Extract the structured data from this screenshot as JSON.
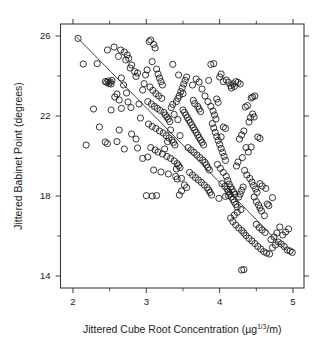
{
  "figure": {
    "background_color": "#ffffff",
    "foreground_color": "#1a1a1a"
  },
  "chart_data": {
    "type": "scatter",
    "title": "",
    "xlabel": "Jittered Cube Root Concentration (μg     /m)",
    "xlabel_parts": {
      "prefix": "Jittered Cube Root Concentration (µg",
      "exponent": "1/3",
      "suffix": "/m)"
    },
    "ylabel": "Jittered Babinet Point (degrees)",
    "xlim": [
      1.83,
      5.15
    ],
    "ylim": [
      13.4,
      26.6
    ],
    "xticks": [
      2,
      3,
      4,
      5
    ],
    "xticklabels": [
      "2",
      "3",
      "4",
      "5"
    ],
    "xticks_minor": [
      2.5,
      3.5,
      4.5
    ],
    "yticks": [
      14,
      18,
      22,
      26
    ],
    "yticklabels": [
      "14",
      "18",
      "22",
      "26"
    ],
    "yticks_minor": [
      16,
      20,
      24
    ],
    "grid": false,
    "legend": null,
    "frame": "box",
    "marker": "open-circle",
    "marker_size_px": 3.1,
    "marker_color": "#151515",
    "n_points": 318,
    "fit_line": {
      "type": "least-squares",
      "x": [
        2.05,
        4.92
      ],
      "y": [
        25.95,
        15.25
      ],
      "slope": -3.73,
      "intercept": 33.6,
      "color": "#2b2b2b"
    },
    "points": [
      [
        2.07,
        25.88
      ],
      [
        2.14,
        24.6
      ],
      [
        2.33,
        24.62
      ],
      [
        2.44,
        23.72
      ],
      [
        2.46,
        23.68
      ],
      [
        2.48,
        23.75
      ],
      [
        2.49,
        23.62
      ],
      [
        2.51,
        23.7
      ],
      [
        2.52,
        23.6
      ],
      [
        2.53,
        23.78
      ],
      [
        2.47,
        25.3
      ],
      [
        2.56,
        25.45
      ],
      [
        2.62,
        24.98
      ],
      [
        2.65,
        25.3
      ],
      [
        2.7,
        25.2
      ],
      [
        2.72,
        24.8
      ],
      [
        2.74,
        25.05
      ],
      [
        2.76,
        24.88
      ],
      [
        2.78,
        24.4
      ],
      [
        2.8,
        24.55
      ],
      [
        2.66,
        23.9
      ],
      [
        2.69,
        23.55
      ],
      [
        2.84,
        24.22
      ],
      [
        2.86,
        23.98
      ],
      [
        2.88,
        24.15
      ],
      [
        2.57,
        22.95
      ],
      [
        2.6,
        23.1
      ],
      [
        2.63,
        22.8
      ],
      [
        2.73,
        23.15
      ],
      [
        2.75,
        22.7
      ],
      [
        2.28,
        22.35
      ],
      [
        2.52,
        22.3
      ],
      [
        2.66,
        22.38
      ],
      [
        2.79,
        22.42
      ],
      [
        2.9,
        22.6
      ],
      [
        2.36,
        21.45
      ],
      [
        2.63,
        21.3
      ],
      [
        2.8,
        21.1
      ],
      [
        2.86,
        20.85
      ],
      [
        2.6,
        20.72
      ],
      [
        2.18,
        20.55
      ],
      [
        2.44,
        20.7
      ],
      [
        2.47,
        20.62
      ],
      [
        2.7,
        20.35
      ],
      [
        2.88,
        20.4
      ],
      [
        2.92,
        21.9
      ],
      [
        2.95,
        23.3
      ],
      [
        2.97,
        23.62
      ],
      [
        2.99,
        24.05
      ],
      [
        3.01,
        24.3
      ],
      [
        3.04,
        25.72
      ],
      [
        3.06,
        25.8
      ],
      [
        3.1,
        25.58
      ],
      [
        3.12,
        25.4
      ],
      [
        3.08,
        24.72
      ],
      [
        3.14,
        24.35
      ],
      [
        3.16,
        24.1
      ],
      [
        3.18,
        23.9
      ],
      [
        3.2,
        23.72
      ],
      [
        3.22,
        23.55
      ],
      [
        3.05,
        23.45
      ],
      [
        3.09,
        23.28
      ],
      [
        3.13,
        23.12
      ],
      [
        3.17,
        23.0
      ],
      [
        3.21,
        22.88
      ],
      [
        3.02,
        22.72
      ],
      [
        3.07,
        22.6
      ],
      [
        3.11,
        22.48
      ],
      [
        3.15,
        22.38
      ],
      [
        3.19,
        22.28
      ],
      [
        3.24,
        22.18
      ],
      [
        3.26,
        22.05
      ],
      [
        3.28,
        21.95
      ],
      [
        3.3,
        21.85
      ],
      [
        3.32,
        21.72
      ],
      [
        3.03,
        21.6
      ],
      [
        3.08,
        21.48
      ],
      [
        3.13,
        21.38
      ],
      [
        3.18,
        21.25
      ],
      [
        3.23,
        21.15
      ],
      [
        3.27,
        21.02
      ],
      [
        3.31,
        20.9
      ],
      [
        3.35,
        20.8
      ],
      [
        3.37,
        20.68
      ],
      [
        3.39,
        20.55
      ],
      [
        3.06,
        20.42
      ],
      [
        3.12,
        20.3
      ],
      [
        3.16,
        20.2
      ],
      [
        3.22,
        20.1
      ],
      [
        3.28,
        19.98
      ],
      [
        3.33,
        19.88
      ],
      [
        3.38,
        19.75
      ],
      [
        3.42,
        19.62
      ],
      [
        3.44,
        19.52
      ],
      [
        3.46,
        19.42
      ],
      [
        3.1,
        19.3
      ],
      [
        3.2,
        19.2
      ],
      [
        3.3,
        19.1
      ],
      [
        3.4,
        18.98
      ],
      [
        3.48,
        18.88
      ],
      [
        3.34,
        22.42
      ],
      [
        3.36,
        22.58
      ],
      [
        3.41,
        22.72
      ],
      [
        3.43,
        22.88
      ],
      [
        3.45,
        23.02
      ],
      [
        3.47,
        23.22
      ],
      [
        3.49,
        23.4
      ],
      [
        3.51,
        23.6
      ],
      [
        3.53,
        23.78
      ],
      [
        3.55,
        23.95
      ],
      [
        3.5,
        22.3
      ],
      [
        3.52,
        22.18
      ],
      [
        3.54,
        22.05
      ],
      [
        3.56,
        21.92
      ],
      [
        3.58,
        21.8
      ],
      [
        3.6,
        21.68
      ],
      [
        3.62,
        21.55
      ],
      [
        3.64,
        21.42
      ],
      [
        3.66,
        21.3
      ],
      [
        3.68,
        21.18
      ],
      [
        3.7,
        21.05
      ],
      [
        3.72,
        20.92
      ],
      [
        3.74,
        20.8
      ],
      [
        3.76,
        20.68
      ],
      [
        3.78,
        20.55
      ],
      [
        3.57,
        20.42
      ],
      [
        3.61,
        20.3
      ],
      [
        3.65,
        20.18
      ],
      [
        3.69,
        20.05
      ],
      [
        3.73,
        19.92
      ],
      [
        3.77,
        19.8
      ],
      [
        3.8,
        19.68
      ],
      [
        3.82,
        19.55
      ],
      [
        3.84,
        19.42
      ],
      [
        3.86,
        19.3
      ],
      [
        3.59,
        19.18
      ],
      [
        3.63,
        19.05
      ],
      [
        3.67,
        18.92
      ],
      [
        3.71,
        18.8
      ],
      [
        3.75,
        18.68
      ],
      [
        3.79,
        18.55
      ],
      [
        3.83,
        18.42
      ],
      [
        3.85,
        18.3
      ],
      [
        3.87,
        18.18
      ],
      [
        3.89,
        18.05
      ],
      [
        3.55,
        18.42
      ],
      [
        3.52,
        18.55
      ],
      [
        3.48,
        18.25
      ],
      [
        3.45,
        18.05
      ],
      [
        3.42,
        18.85
      ],
      [
        3.43,
        21.82
      ],
      [
        3.38,
        22.08
      ],
      [
        3.33,
        21.3
      ],
      [
        3.29,
        20.72
      ],
      [
        3.25,
        20.35
      ],
      [
        3.36,
        24.58
      ],
      [
        3.44,
        24.05
      ],
      [
        3.5,
        23.12
      ],
      [
        3.46,
        21.02
      ],
      [
        3.41,
        19.35
      ],
      [
        3.63,
        23.55
      ],
      [
        3.68,
        23.85
      ],
      [
        3.72,
        23.7
      ],
      [
        3.76,
        23.35
      ],
      [
        3.8,
        23.0
      ],
      [
        3.84,
        22.72
      ],
      [
        3.88,
        22.48
      ],
      [
        3.91,
        22.25
      ],
      [
        3.93,
        22.05
      ],
      [
        3.95,
        21.85
      ],
      [
        3.9,
        21.62
      ],
      [
        3.92,
        21.4
      ],
      [
        3.94,
        21.18
      ],
      [
        3.96,
        20.98
      ],
      [
        3.98,
        20.78
      ],
      [
        4.0,
        20.58
      ],
      [
        4.02,
        20.38
      ],
      [
        4.04,
        20.18
      ],
      [
        4.06,
        19.98
      ],
      [
        4.08,
        19.78
      ],
      [
        3.97,
        19.58
      ],
      [
        4.01,
        19.38
      ],
      [
        4.05,
        19.18
      ],
      [
        4.09,
        18.98
      ],
      [
        4.11,
        18.78
      ],
      [
        4.13,
        18.6
      ],
      [
        4.15,
        18.45
      ],
      [
        4.17,
        18.32
      ],
      [
        4.19,
        18.2
      ],
      [
        4.21,
        18.08
      ],
      [
        4.03,
        18.62
      ],
      [
        4.07,
        18.48
      ],
      [
        4.1,
        18.35
      ],
      [
        4.12,
        18.22
      ],
      [
        4.14,
        18.1
      ],
      [
        4.16,
        17.95
      ],
      [
        4.18,
        17.82
      ],
      [
        4.2,
        17.7
      ],
      [
        4.22,
        17.58
      ],
      [
        4.24,
        17.45
      ],
      [
        3.99,
        17.88
      ],
      [
        4.26,
        17.95
      ],
      [
        4.28,
        18.1
      ],
      [
        4.3,
        18.28
      ],
      [
        4.32,
        18.45
      ],
      [
        4.05,
        23.72
      ],
      [
        4.09,
        23.8
      ],
      [
        4.12,
        23.68
      ],
      [
        4.15,
        23.52
      ],
      [
        4.18,
        23.6
      ],
      [
        3.88,
        24.58
      ],
      [
        3.92,
        24.62
      ],
      [
        4.0,
        23.95
      ],
      [
        4.02,
        24.1
      ],
      [
        3.85,
        23.78
      ],
      [
        4.35,
        22.45
      ],
      [
        4.38,
        22.52
      ],
      [
        4.43,
        22.9
      ],
      [
        4.45,
        22.95
      ],
      [
        4.48,
        23.0
      ],
      [
        4.42,
        21.92
      ],
      [
        4.4,
        21.7
      ],
      [
        4.33,
        21.25
      ],
      [
        4.3,
        21.05
      ],
      [
        4.27,
        20.85
      ],
      [
        4.36,
        20.42
      ],
      [
        4.39,
        20.2
      ],
      [
        4.31,
        19.92
      ],
      [
        4.25,
        19.7
      ],
      [
        4.23,
        19.5
      ],
      [
        4.34,
        19.28
      ],
      [
        4.37,
        19.05
      ],
      [
        4.41,
        18.88
      ],
      [
        4.44,
        18.7
      ],
      [
        4.46,
        18.52
      ],
      [
        4.49,
        18.35
      ],
      [
        4.51,
        18.18
      ],
      [
        4.47,
        17.95
      ],
      [
        4.5,
        17.72
      ],
      [
        4.53,
        17.55
      ],
      [
        4.55,
        17.4
      ],
      [
        4.57,
        17.25
      ],
      [
        4.29,
        17.32
      ],
      [
        4.24,
        17.18
      ],
      [
        4.2,
        17.05
      ],
      [
        4.15,
        16.9
      ],
      [
        4.18,
        16.72
      ],
      [
        4.22,
        16.55
      ],
      [
        4.26,
        16.4
      ],
      [
        4.3,
        16.28
      ],
      [
        4.33,
        16.15
      ],
      [
        4.36,
        16.02
      ],
      [
        4.4,
        15.88
      ],
      [
        4.44,
        15.75
      ],
      [
        4.48,
        15.62
      ],
      [
        4.52,
        15.48
      ],
      [
        4.56,
        15.35
      ],
      [
        4.6,
        15.22
      ],
      [
        4.64,
        15.15
      ],
      [
        4.68,
        15.1
      ],
      [
        4.72,
        15.42
      ],
      [
        4.76,
        15.55
      ],
      [
        4.8,
        15.7
      ],
      [
        4.84,
        15.6
      ],
      [
        4.88,
        15.48
      ],
      [
        4.92,
        15.3
      ],
      [
        4.96,
        15.25
      ],
      [
        4.99,
        15.18
      ],
      [
        4.86,
        16.05
      ],
      [
        4.9,
        16.2
      ],
      [
        4.94,
        16.35
      ],
      [
        4.82,
        16.45
      ],
      [
        4.78,
        16.15
      ],
      [
        4.74,
        15.95
      ],
      [
        4.7,
        15.82
      ],
      [
        4.62,
        16.18
      ],
      [
        4.58,
        16.3
      ],
      [
        4.54,
        16.42
      ],
      [
        4.5,
        16.58
      ],
      [
        4.61,
        17.02
      ],
      [
        4.65,
        17.6
      ],
      [
        4.67,
        17.52
      ],
      [
        4.55,
        18.62
      ],
      [
        4.58,
        18.5
      ],
      [
        4.63,
        18.38
      ],
      [
        4.72,
        17.92
      ],
      [
        4.3,
        14.3
      ],
      [
        4.33,
        14.32
      ],
      [
        4.12,
        18.02
      ],
      [
        4.08,
        17.98
      ],
      [
        3.0,
        18.02
      ],
      [
        3.08,
        18.0
      ],
      [
        3.14,
        18.02
      ],
      [
        2.95,
        19.88
      ],
      [
        3.02,
        19.95
      ],
      [
        4.45,
        22.1
      ],
      [
        4.47,
        21.95
      ],
      [
        4.52,
        20.95
      ],
      [
        4.55,
        20.88
      ],
      [
        4.43,
        20.45
      ],
      [
        4.05,
        21.45
      ],
      [
        4.08,
        21.38
      ],
      [
        4.02,
        20.95
      ],
      [
        3.96,
        22.85
      ],
      [
        3.98,
        22.68
      ],
      [
        4.22,
        23.72
      ],
      [
        4.25,
        23.68
      ],
      [
        4.28,
        23.6
      ],
      [
        4.2,
        23.48
      ],
      [
        4.16,
        23.4
      ],
      [
        3.72,
        22.35
      ],
      [
        3.74,
        22.22
      ],
      [
        3.7,
        22.48
      ],
      [
        3.66,
        22.62
      ],
      [
        3.64,
        22.78
      ]
    ]
  }
}
